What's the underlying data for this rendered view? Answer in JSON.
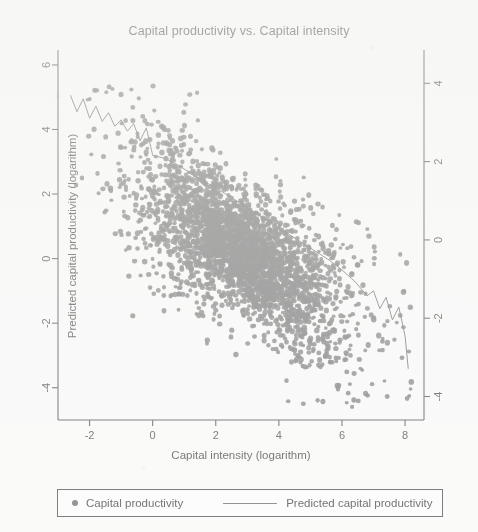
{
  "chart_data": {
    "type": "scatter",
    "title": "Capital productivity vs. Capital intensity",
    "xlabel": "Capital intensity (logarithm)",
    "ylabel": "Predicted capital productivity (logarithm)",
    "ylabel_right": "",
    "xlim": [
      -3.0,
      8.6
    ],
    "ylim_left": [
      -5.0,
      6.4
    ],
    "ylim_right": [
      -4.6,
      4.8
    ],
    "xticks": [
      -2,
      0,
      2,
      4,
      6,
      8
    ],
    "xtick_labels": [
      "-2",
      "0",
      "2",
      "4",
      "6",
      "8"
    ],
    "yticks_left": [
      -4,
      -2,
      0,
      2,
      4,
      6
    ],
    "ytick_labels_left": [
      "-4",
      "-2",
      "0",
      "2",
      "4",
      "6"
    ],
    "yticks_right": [
      -4,
      -2,
      0,
      2,
      4
    ],
    "ytick_labels_right": [
      "-4",
      "-2",
      "0",
      "2",
      "4"
    ],
    "grid": false,
    "legend_position": "bottom",
    "marker_color": "#6f6f6f",
    "line_color": "#6b6b6b",
    "series": [
      {
        "name": "Capital productivity",
        "kind": "scatter",
        "n_points": 3000,
        "marker": "circle",
        "description": "Dense negatively-correlated cloud of firm observations; slope approximately -0.62, intercept approximately 2.0, residual spread approximately 0.95; x concentrated between 0 and 6.5 with sparse tails to -2.6 and 8.2",
        "fit_slope": -0.62,
        "fit_intercept": 2.0,
        "x_range": [
          -2.6,
          8.2
        ],
        "y_range": [
          -4.6,
          5.4
        ]
      },
      {
        "name": "Predicted capital productivity",
        "kind": "line",
        "description": "Jagged non-parametric prediction curve declining from about 5.1 at x=-2.6 to about -3.4 at x=8.1, with high-frequency noise at both sparse tails and a smooth steep descent through the dense middle",
        "x": [
          -2.6,
          -2.4,
          -2.2,
          -2.0,
          -1.8,
          -1.6,
          -1.4,
          -1.2,
          -1.0,
          -0.8,
          -0.6,
          -0.4,
          -0.2,
          0.0,
          0.4,
          0.8,
          1.2,
          1.6,
          2.0,
          2.4,
          2.8,
          3.2,
          3.6,
          4.0,
          4.4,
          4.8,
          5.2,
          5.6,
          6.0,
          6.4,
          6.8,
          7.0,
          7.2,
          7.4,
          7.6,
          7.8,
          8.0,
          8.1
        ],
        "y": [
          5.05,
          4.55,
          4.95,
          4.35,
          4.72,
          4.25,
          4.52,
          4.1,
          4.3,
          3.95,
          4.18,
          3.65,
          4.05,
          3.2,
          3.1,
          2.9,
          2.65,
          2.4,
          2.2,
          1.95,
          1.7,
          1.45,
          1.2,
          0.95,
          0.7,
          0.45,
          0.2,
          -0.05,
          -0.35,
          -0.7,
          -1.15,
          -1.0,
          -1.55,
          -1.2,
          -1.9,
          -1.5,
          -2.4,
          -3.4
        ]
      }
    ]
  },
  "legend": {
    "items": [
      {
        "label": "Capital productivity",
        "symbol": "dot"
      },
      {
        "label": "Predicted capital productivity",
        "symbol": "line"
      }
    ]
  }
}
